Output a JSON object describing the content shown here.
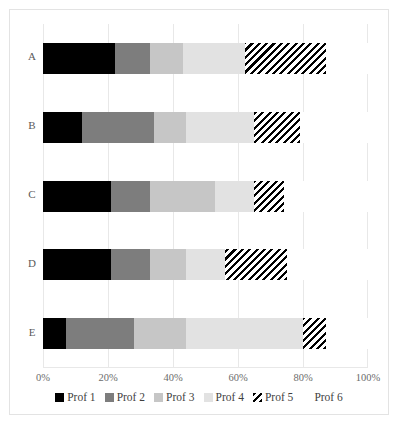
{
  "chart_data": {
    "type": "bar",
    "orientation": "horizontal",
    "stacked": true,
    "normalized_percent": true,
    "title": "",
    "xlabel": "",
    "ylabel": "",
    "categories": [
      "A",
      "B",
      "C",
      "D",
      "E"
    ],
    "xlim": [
      0,
      100
    ],
    "xticks": [
      0,
      20,
      40,
      60,
      80,
      100
    ],
    "xtick_labels": [
      "0%",
      "20%",
      "40%",
      "60%",
      "80%",
      "100%"
    ],
    "grid": true,
    "legend_position": "bottom",
    "series": [
      {
        "name": "Prof 1",
        "fill": "solid-black",
        "color": "#000000",
        "values": [
          22,
          12,
          21,
          21,
          7
        ]
      },
      {
        "name": "Prof 2",
        "fill": "solid-dark-gray",
        "color": "#7d7d7d",
        "values": [
          11,
          22,
          12,
          12,
          21
        ]
      },
      {
        "name": "Prof 3",
        "fill": "solid-medium-gray",
        "color": "#c6c6c6",
        "values": [
          10,
          10,
          20,
          11,
          16
        ]
      },
      {
        "name": "Prof 4",
        "fill": "solid-light-gray",
        "color": "#e2e2e2",
        "values": [
          19,
          21,
          12,
          12,
          36
        ]
      },
      {
        "name": "Prof 5",
        "fill": "diagonal-hatch",
        "color": "#000000",
        "values": [
          25,
          14,
          9,
          19,
          7
        ]
      },
      {
        "name": "Prof 6",
        "fill": "checkerboard",
        "color": "#000000",
        "values": [
          13,
          21,
          26,
          25,
          13
        ]
      }
    ]
  }
}
